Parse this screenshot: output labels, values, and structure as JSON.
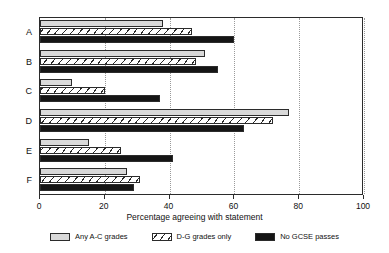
{
  "chart_data": {
    "type": "bar",
    "orientation": "horizontal",
    "title": "",
    "xlabel": "Percentage agreeing with statement",
    "ylabel": "",
    "xlim": [
      0,
      100
    ],
    "xticks": [
      0,
      20,
      40,
      60,
      80,
      100
    ],
    "xtick_labels": [
      "0",
      "20",
      "40",
      "60",
      "80",
      "100"
    ],
    "grid": "vertical dotted gridlines at x ticks",
    "legend_position": "below axes, centered, horizontal",
    "categories": [
      "A",
      "B",
      "C",
      "D",
      "E",
      "F"
    ],
    "series": [
      {
        "name": "Any A-C grades",
        "color": "#d9d9d9",
        "fill": "light-grey-solid",
        "values": [
          38,
          51,
          10,
          77,
          15,
          27
        ]
      },
      {
        "name": "D-G grades only",
        "color": "#ffffff",
        "fill": "diagonal-hatch",
        "values": [
          47,
          48,
          20,
          72,
          25,
          31
        ]
      },
      {
        "name": "No GCSE passes",
        "color": "#151515",
        "fill": "black-solid",
        "values": [
          60,
          55,
          37,
          63,
          41,
          29
        ]
      }
    ]
  },
  "legend": {
    "entries": [
      {
        "label": "Any A-C grades",
        "swatch": "light-grey-swatch"
      },
      {
        "label": "D-G grades only",
        "swatch": "hatched-swatch"
      },
      {
        "label": "No GCSE passes",
        "swatch": "black-swatch"
      }
    ]
  },
  "axis": {
    "x_title": "Percentage agreeing with statement"
  }
}
